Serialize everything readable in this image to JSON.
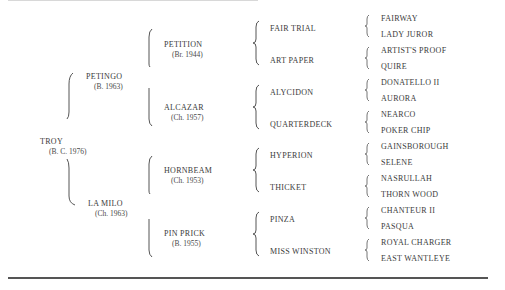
{
  "subject": {
    "name": "TROY",
    "detail": "(B. C. 1976)"
  },
  "gen1": [
    {
      "name": "PETINGO",
      "detail": "(B. 1963)"
    },
    {
      "name": "LA MILO",
      "detail": "(Ch. 1963)"
    }
  ],
  "gen2": [
    {
      "name": "PETITION",
      "detail": "(Br. 1944)"
    },
    {
      "name": "ALCAZAR",
      "detail": "(Ch. 1957)"
    },
    {
      "name": "HORNBEAM",
      "detail": "(Ch. 1953)"
    },
    {
      "name": "PIN PRICK",
      "detail": "(B. 1955)"
    }
  ],
  "gen3": [
    {
      "name": "FAIR TRIAL"
    },
    {
      "name": "ART PAPER"
    },
    {
      "name": "ALYCIDON"
    },
    {
      "name": "QUARTERDECK"
    },
    {
      "name": "HYPERION"
    },
    {
      "name": "THICKET"
    },
    {
      "name": "PINZA"
    },
    {
      "name": "MISS WINSTON"
    }
  ],
  "gen4": [
    {
      "name": "FAIRWAY"
    },
    {
      "name": "LADY JUROR"
    },
    {
      "name": "ARTIST'S PROOF"
    },
    {
      "name": "QUIRE"
    },
    {
      "name": "DONATELLO II"
    },
    {
      "name": "AURORA"
    },
    {
      "name": "NEARCO"
    },
    {
      "name": "POKER CHIP"
    },
    {
      "name": "GAINSBOROUGH"
    },
    {
      "name": "SELENE"
    },
    {
      "name": "NASRULLAH"
    },
    {
      "name": "THORN WOOD"
    },
    {
      "name": "CHANTEUR II"
    },
    {
      "name": "PASQUA"
    },
    {
      "name": "ROYAL CHARGER"
    },
    {
      "name": "EAST WANTLEYE"
    }
  ]
}
